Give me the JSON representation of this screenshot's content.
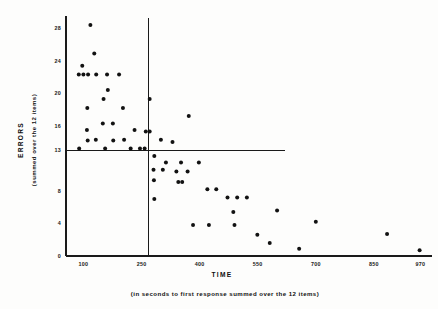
{
  "chart_data": {
    "type": "scatter",
    "title": "",
    "xlabel": "TIME",
    "xlabel_sub": "(in seconds to first response summed over the 12 items)",
    "ylabel": "ERRORS",
    "ylabel_sub": "(summed over the 12 items)",
    "xticks": [
      100,
      250,
      400,
      550,
      700,
      850,
      970
    ],
    "xtick_labels": [
      "100",
      "250",
      "400",
      "550",
      "700",
      "850",
      "970"
    ],
    "yticks": [
      0,
      4,
      8,
      13,
      16,
      20,
      24,
      28
    ],
    "ytick_labels": [
      "0",
      "4",
      "8",
      "13",
      "16",
      "20",
      "24",
      "28"
    ],
    "xlim": [
      55,
      1000
    ],
    "ylim": [
      0,
      29.5
    ],
    "grid": false,
    "legend": null,
    "marker": "filled-circle",
    "marker_color": "#121212",
    "reference_lines": [
      {
        "orientation": "horizontal",
        "value": 13,
        "x_from": 55,
        "x_to": 620,
        "label": "median errors"
      },
      {
        "orientation": "vertical",
        "value": 268,
        "y_from": 0,
        "y_to": 29.3,
        "label": "median time"
      }
    ],
    "points": [
      {
        "x": 118,
        "y": 28.4
      },
      {
        "x": 128,
        "y": 24.9
      },
      {
        "x": 97,
        "y": 23.4
      },
      {
        "x": 88,
        "y": 22.3
      },
      {
        "x": 100,
        "y": 22.3
      },
      {
        "x": 112,
        "y": 22.3
      },
      {
        "x": 133,
        "y": 22.3
      },
      {
        "x": 161,
        "y": 22.3
      },
      {
        "x": 192,
        "y": 22.3
      },
      {
        "x": 163,
        "y": 20.4
      },
      {
        "x": 152,
        "y": 19.3
      },
      {
        "x": 271,
        "y": 19.3
      },
      {
        "x": 110,
        "y": 18.2
      },
      {
        "x": 202,
        "y": 18.2
      },
      {
        "x": 372,
        "y": 17.2
      },
      {
        "x": 150,
        "y": 16.3
      },
      {
        "x": 176,
        "y": 16.3
      },
      {
        "x": 109,
        "y": 15.5
      },
      {
        "x": 232,
        "y": 15.5
      },
      {
        "x": 261,
        "y": 15.3
      },
      {
        "x": 271,
        "y": 15.3
      },
      {
        "x": 132,
        "y": 14.3
      },
      {
        "x": 205,
        "y": 14.3
      },
      {
        "x": 300,
        "y": 14.3
      },
      {
        "x": 111,
        "y": 14.2
      },
      {
        "x": 177,
        "y": 14.2
      },
      {
        "x": 330,
        "y": 14.0
      },
      {
        "x": 89,
        "y": 13.2
      },
      {
        "x": 156,
        "y": 13.2
      },
      {
        "x": 222,
        "y": 13.2
      },
      {
        "x": 246,
        "y": 13.2
      },
      {
        "x": 258,
        "y": 13.2
      },
      {
        "x": 283,
        "y": 12.3
      },
      {
        "x": 313,
        "y": 11.5
      },
      {
        "x": 352,
        "y": 11.5
      },
      {
        "x": 398,
        "y": 11.5
      },
      {
        "x": 281,
        "y": 10.6
      },
      {
        "x": 305,
        "y": 10.6
      },
      {
        "x": 340,
        "y": 10.4
      },
      {
        "x": 369,
        "y": 10.4
      },
      {
        "x": 282,
        "y": 9.3
      },
      {
        "x": 345,
        "y": 9.1
      },
      {
        "x": 355,
        "y": 9.1
      },
      {
        "x": 420,
        "y": 8.2
      },
      {
        "x": 443,
        "y": 8.2
      },
      {
        "x": 283,
        "y": 7.0
      },
      {
        "x": 472,
        "y": 7.2
      },
      {
        "x": 497,
        "y": 7.2
      },
      {
        "x": 522,
        "y": 7.2
      },
      {
        "x": 487,
        "y": 5.4
      },
      {
        "x": 600,
        "y": 5.6
      },
      {
        "x": 383,
        "y": 3.8
      },
      {
        "x": 424,
        "y": 3.8
      },
      {
        "x": 490,
        "y": 3.8
      },
      {
        "x": 700,
        "y": 4.2
      },
      {
        "x": 549,
        "y": 2.6
      },
      {
        "x": 581,
        "y": 1.6
      },
      {
        "x": 884,
        "y": 2.7
      },
      {
        "x": 657,
        "y": 0.9
      },
      {
        "x": 968,
        "y": 0.7
      }
    ]
  }
}
